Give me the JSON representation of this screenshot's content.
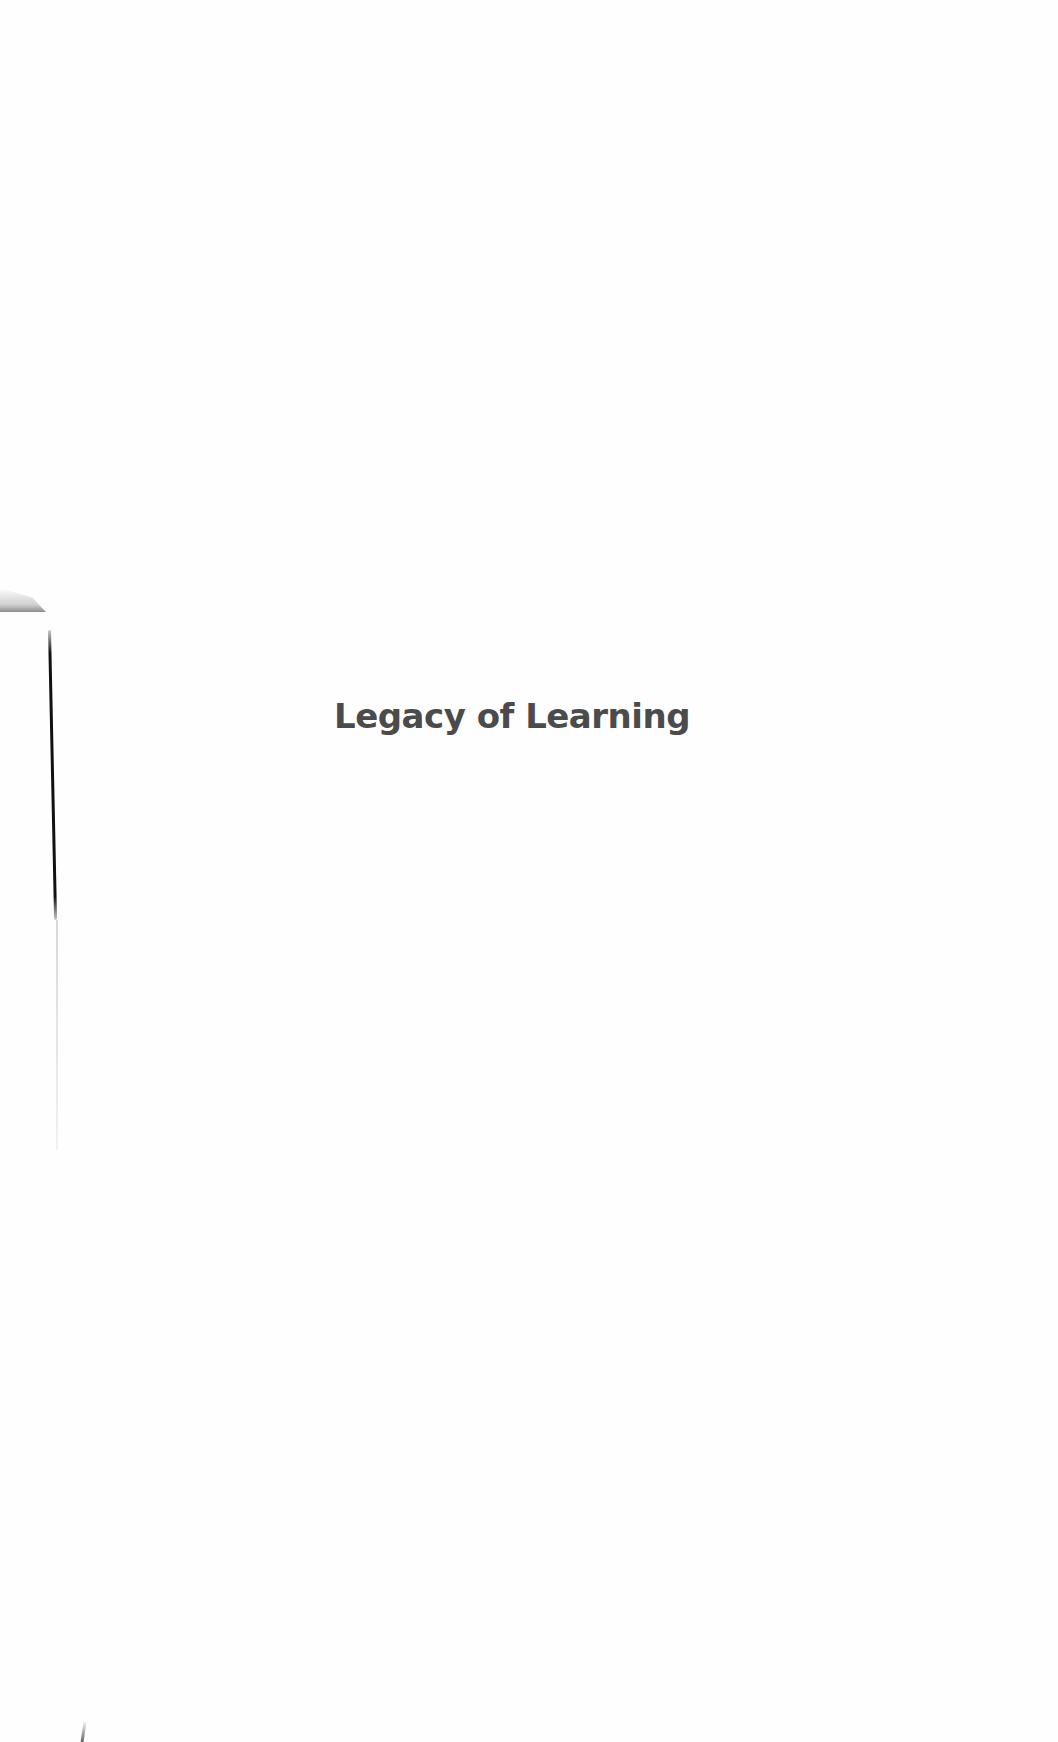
{
  "page": {
    "title": "Legacy of Learning",
    "colors": {
      "background": "#fefefe",
      "title_text": "#4b4b4b",
      "scan_edge": "#111111"
    }
  }
}
